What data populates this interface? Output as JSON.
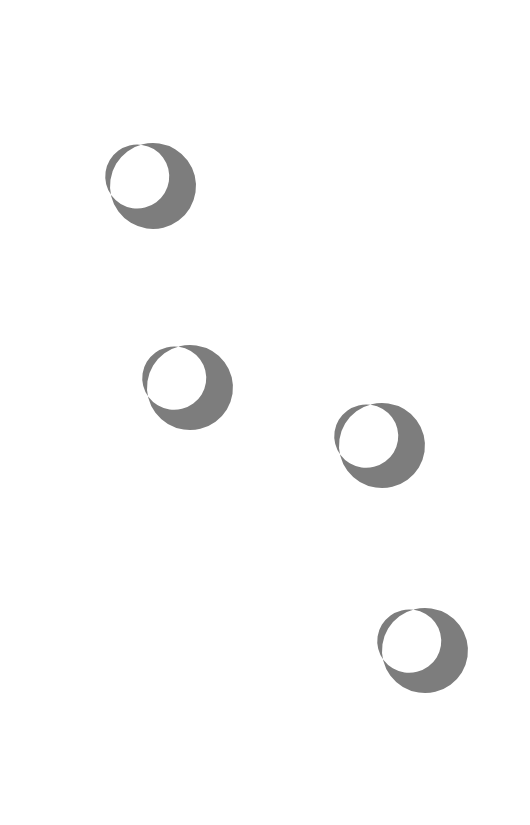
{
  "canvas": {
    "width": 530,
    "height": 825,
    "background_color": "#ffffff",
    "title": "Crescent Pattern"
  },
  "style": {
    "shape_fill_color": "#7d7d7d",
    "shape_count": 4,
    "shape_kind": "crescent-moon",
    "opening_direction": "upper-left"
  },
  "shapes": [
    {
      "id": "crescent-1",
      "name": "crescent-shape-1",
      "x": 110,
      "y": 143,
      "width": 86,
      "height": 86,
      "rotation": -14,
      "outer": {
        "cx": 43,
        "cy": 43,
        "r": 43
      },
      "inner": {
        "cx": 30,
        "cy": 30,
        "r": 32
      },
      "fill": "#7d7d7d"
    },
    {
      "id": "crescent-2",
      "name": "crescent-shape-2",
      "x": 147,
      "y": 345,
      "width": 86,
      "height": 85,
      "rotation": -14,
      "outer": {
        "cx": 43,
        "cy": 43,
        "r": 43
      },
      "inner": {
        "cx": 30,
        "cy": 30,
        "r": 32
      },
      "fill": "#7d7d7d"
    },
    {
      "id": "crescent-3",
      "name": "crescent-shape-3",
      "x": 339,
      "y": 403,
      "width": 86,
      "height": 85,
      "rotation": -14,
      "outer": {
        "cx": 43,
        "cy": 43,
        "r": 43
      },
      "inner": {
        "cx": 30,
        "cy": 30,
        "r": 32
      },
      "fill": "#7d7d7d"
    },
    {
      "id": "crescent-4",
      "name": "crescent-shape-4",
      "x": 382,
      "y": 608,
      "width": 86,
      "height": 85,
      "rotation": -14,
      "outer": {
        "cx": 43,
        "cy": 43,
        "r": 43
      },
      "inner": {
        "cx": 30,
        "cy": 30,
        "r": 32
      },
      "fill": "#7d7d7d"
    }
  ]
}
